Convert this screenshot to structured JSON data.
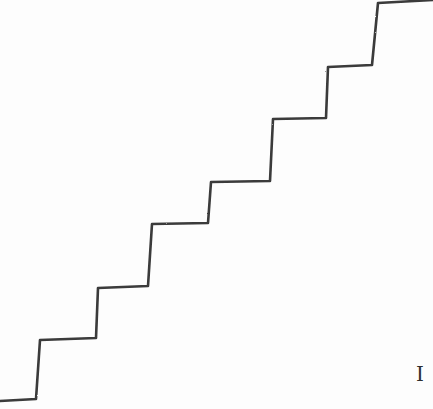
{
  "drawing": {
    "subject": "hand-drawn staircase",
    "stroke_color": "#3a3a3a",
    "background_color": "#fdfdfd",
    "steps": 8,
    "points": "0,401 36,399 40,340 96,338 98,288 148,286 152,224 208,223 211,182 270,181 273,119 326,118 328,67 372,65 378,3 433,0"
  },
  "corner_mark": {
    "text": "I"
  }
}
